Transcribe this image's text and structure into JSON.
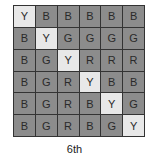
{
  "grid": {
    "rows": [
      [
        "Y",
        "B",
        "B",
        "B",
        "B",
        "B"
      ],
      [
        "B",
        "Y",
        "G",
        "G",
        "G",
        "G"
      ],
      [
        "B",
        "G",
        "Y",
        "R",
        "R",
        "R"
      ],
      [
        "B",
        "G",
        "R",
        "Y",
        "B",
        "B"
      ],
      [
        "B",
        "G",
        "R",
        "B",
        "Y",
        "G"
      ],
      [
        "B",
        "G",
        "R",
        "B",
        "G",
        "Y"
      ]
    ],
    "highlight_value": "Y",
    "colors": {
      "dark_cell": "#8c8c8c",
      "light_cell": "#e8e8e8",
      "border": "#333333"
    }
  },
  "caption": "6th"
}
